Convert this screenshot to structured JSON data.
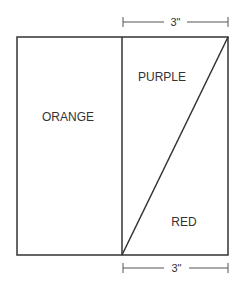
{
  "diagram": {
    "type": "folded-panel-layout",
    "regions": [
      {
        "id": "orange",
        "label": "ORANGE"
      },
      {
        "id": "purple",
        "label": "PURPLE"
      },
      {
        "id": "red",
        "label": "RED"
      }
    ],
    "dimensions": {
      "top": "3\"",
      "bottom": "3\""
    },
    "colors": {
      "stroke": "#333333",
      "dim_stroke": "#555555",
      "background": "#ffffff"
    }
  }
}
